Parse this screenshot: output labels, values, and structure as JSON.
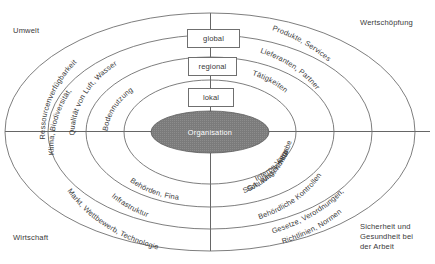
{
  "diagram": {
    "center": {
      "label": "Organisation",
      "fill": "#7b7b7b",
      "text_color": "#ffffff"
    },
    "corner_labels": {
      "top_left": "Umwelt",
      "top_right": "Wertschöpfung",
      "bottom_left": "Wirtschaft",
      "bottom_right": "Sicherheit und\nGesundheit bei\nder Arbeit"
    },
    "level_boxes": [
      {
        "label": "global"
      },
      {
        "label": "regional"
      },
      {
        "label": "lokal"
      }
    ],
    "rings": [
      {
        "index": 1,
        "quadrant_labels": {
          "top_left": "Bodennutzung",
          "top_right": "Tätigkeiten",
          "bottom_left": "Behörden, Finanzen",
          "bottom_right": "Interne Vorgaben,\nSGA, Wissen Mitarbeiter,\nSchulung, Kontrolle"
        }
      },
      {
        "index": 2,
        "quadrant_labels": {
          "top_left": "Qualität von Luft, Wasser",
          "top_right": "Lieferanten, Partner",
          "bottom_left": "Infrastruktur",
          "bottom_right": "Behördliche Kontrollen"
        }
      },
      {
        "index": 3,
        "quadrant_labels": {
          "top_left": "Klima, Biodiversität,\nRessourcenverfügbarkeit",
          "top_right": "Produkte, Services",
          "bottom_left": "Markt, Wettbewerb, Technologie",
          "bottom_right": "Gesetze, Verordnungen,\nRichtlinien, Normen"
        }
      },
      {
        "index": 4,
        "quadrant_labels": {}
      }
    ],
    "colors": {
      "stroke": "#6f6f6f",
      "axis": "#555555",
      "text": "#3a3a3a",
      "center_fill": "#7b7b7b",
      "background": "#ffffff"
    }
  }
}
